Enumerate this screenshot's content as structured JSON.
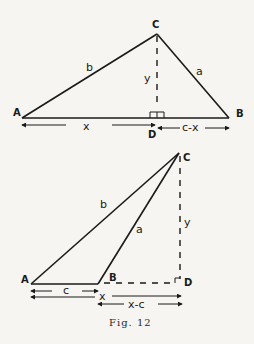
{
  "figure": {
    "caption": "Fig. 12",
    "top_triangle": {
      "vertices": {
        "A": "A",
        "B": "B",
        "C": "C",
        "D": "D"
      },
      "sides": {
        "b": "b",
        "a": "a",
        "y": "y"
      },
      "measures": {
        "x": "x",
        "c_minus_x": "c-x"
      }
    },
    "bottom_triangle": {
      "vertices": {
        "A": "A",
        "B": "B",
        "C": "C",
        "D": "D"
      },
      "sides": {
        "b": "b",
        "a": "a",
        "y": "y"
      },
      "measures": {
        "c": "c",
        "x": "x",
        "x_minus_c": "x-c"
      }
    }
  }
}
